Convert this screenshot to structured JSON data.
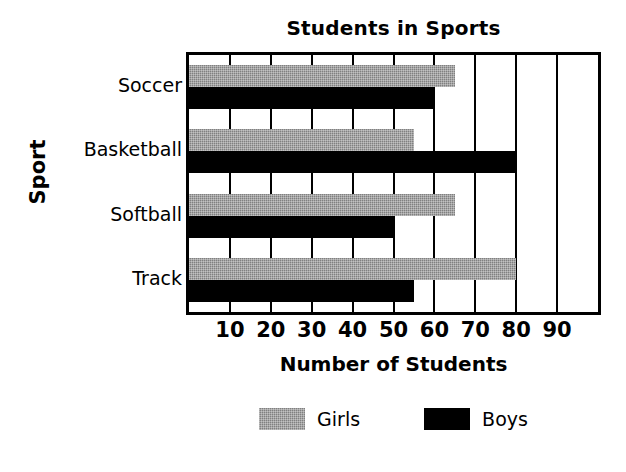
{
  "chart_data": {
    "type": "bar",
    "orientation": "horizontal",
    "title": "Students in Sports",
    "xlabel": "Number of Students",
    "ylabel": "Sport",
    "categories": [
      "Soccer",
      "Basketball",
      "Softball",
      "Track"
    ],
    "series": [
      {
        "name": "Girls",
        "color": "#808080",
        "values": [
          65,
          55,
          65,
          80
        ]
      },
      {
        "name": "Boys",
        "color": "#000000",
        "values": [
          60,
          80,
          50,
          55
        ]
      }
    ],
    "xlim": [
      0,
      100
    ],
    "xticks": [
      10,
      20,
      30,
      40,
      50,
      60,
      70,
      80,
      90
    ],
    "xtick_labels": [
      "10",
      "20",
      "30",
      "40",
      "50",
      "60",
      "70",
      "80",
      "90"
    ],
    "grid": true,
    "grid_axis": "x",
    "legend_position": "bottom",
    "legend_entries": [
      "Girls",
      "Boys"
    ],
    "background": "#ffffff",
    "frame_color": "#000000"
  }
}
